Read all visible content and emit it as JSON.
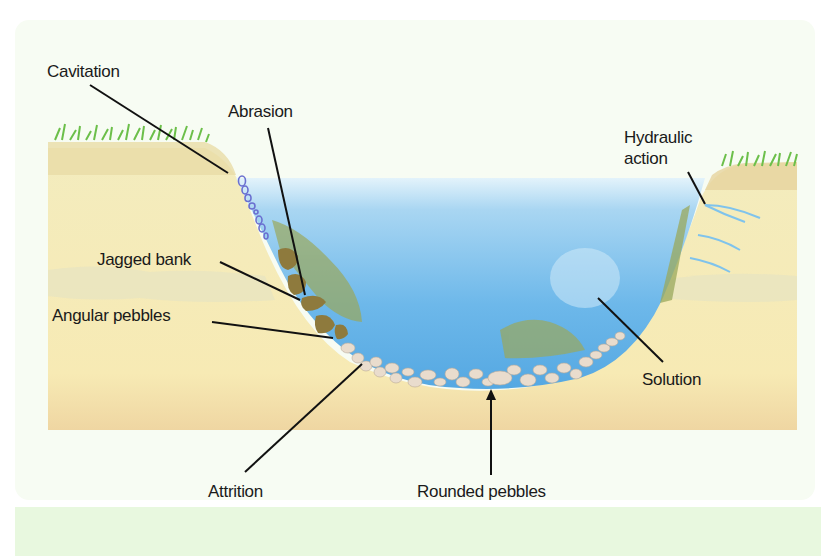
{
  "diagram": {
    "colors": {
      "panel_background": "#f7fcf3",
      "bottom_band": "#e8f8df",
      "bank_soil": "#f5ecb8",
      "bank_top_soil": "#e2cf99",
      "water_top": "#dff1fb",
      "water_deep": "#5aaee6",
      "grass": "#6cbf4a",
      "angular_pebbles": "#8e7a3d",
      "rounded_pebbles": "#e9dccd",
      "cavitation_bubbles": "#6a6fd0",
      "leader_line": "#111111"
    },
    "labels": {
      "cavitation": "Cavitation",
      "abrasion": "Abrasion",
      "jagged_bank": "Jagged bank",
      "angular_pebbles": "Angular pebbles",
      "hydraulic_action_line1": "Hydraulic",
      "hydraulic_action_line2": "action",
      "solution": "Solution",
      "attrition": "Attrition",
      "rounded_pebbles": "Rounded pebbles"
    }
  }
}
